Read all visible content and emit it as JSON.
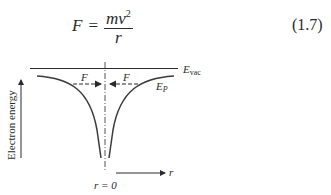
{
  "equation": {
    "lhs": "F",
    "operator": "=",
    "numerator": "mv",
    "numerator_exponent": "2",
    "denominator": "r",
    "number": "(1.7)"
  },
  "figure": {
    "y_axis_label": "Electron energy",
    "x_axis_label": "r",
    "origin_label": "r = 0",
    "vacuum_level_label": "E",
    "vacuum_level_subscript": "vac",
    "potential_label": "E",
    "potential_subscript": "P",
    "force_left_label": "F",
    "force_right_label": "F"
  }
}
